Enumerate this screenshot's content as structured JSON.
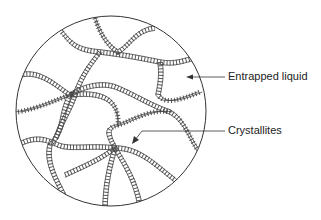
{
  "diagram": {
    "labels": [
      {
        "id": "entrapped",
        "text": "Entrapped liquid"
      },
      {
        "id": "crystallites",
        "text": "Crystallites"
      }
    ],
    "colors": {
      "line": "#333333",
      "background": "#ffffff"
    }
  }
}
